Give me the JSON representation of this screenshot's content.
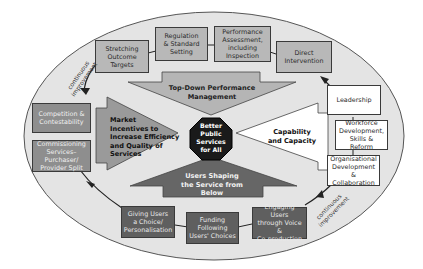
{
  "diagram": {
    "title": "Better Public Services for All",
    "center": {
      "label": "Better\nPublic\nServices\nfor All"
    },
    "arrows": {
      "top": {
        "label": "Top-Down Performance\nManagement",
        "color": "#b5b5b5"
      },
      "left": {
        "label": "Market\nIncentives to\nIncrease Efficiency\nand Quality of\nServices",
        "color": "#9a9a9a"
      },
      "right": {
        "label": "Capability\nand Capacity",
        "color": "#ffffff"
      },
      "bottom": {
        "label": "Users Shaping\nthe Service from\nBelow",
        "color": "#666666"
      }
    },
    "top_boxes": [
      {
        "label": "Stretching\nOutcome\nTargets"
      },
      {
        "label": "Regulation\n& Standard\nSetting"
      },
      {
        "label": "Performance\nAssessment,\nincluding\nInspection"
      },
      {
        "label": "Direct\nIntervention"
      }
    ],
    "left_boxes": [
      {
        "label": "Competition &\nContestability"
      },
      {
        "label": "Commissioning\nServices–Purchaser/\nProvider Split"
      }
    ],
    "bottom_boxes": [
      {
        "label": "Giving Users\na Choice/\nPersonalisation"
      },
      {
        "label": "Funding\nFollowing\nUsers' Choices"
      },
      {
        "label": "Engaging Users\nthrough Voice &\nCo-production"
      }
    ],
    "right_boxes": [
      {
        "label": "Leadership"
      },
      {
        "label": "Workforce\nDevelopment,\nSkills & Reform"
      },
      {
        "label": "Organisational\nDevelopment &\nCollaboration"
      }
    ],
    "cycle_labels": {
      "top_left": "continuous\nimprovement",
      "bottom_right": "continuous\nimprovement"
    },
    "colors": {
      "ellipse_fill": "#e4e4e4",
      "ellipse_stroke": "#555555",
      "center_fill": "#1a1a1a"
    }
  }
}
